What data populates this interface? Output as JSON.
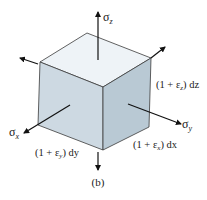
{
  "figure": {
    "caption": "(b)",
    "colors": {
      "top_face": "#eef3f7",
      "left_face": "#cdd9e2",
      "right_face": "#b9c9d4",
      "edges": "#3a3a3a",
      "arrows": "#111111"
    },
    "stress_labels": {
      "sigma_z": "σ",
      "sigma_z_sub": "z",
      "sigma_x": "σ",
      "sigma_x_sub": "x",
      "sigma_y": "σ",
      "sigma_y_sub": "y"
    },
    "dimension_labels": {
      "dz_prefix": "(1 + ε",
      "dz_sub": "z",
      "dz_suffix": ") dz",
      "dy_prefix": "(1 + ε",
      "dy_sub": "y",
      "dy_suffix": ") dy",
      "dx_prefix": "(1 + ε",
      "dx_sub": "x",
      "dx_suffix": ") dx"
    }
  }
}
